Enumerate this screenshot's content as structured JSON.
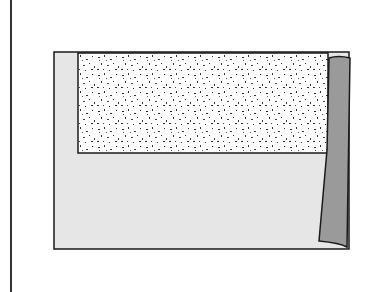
{
  "figure": {
    "colors": {
      "background": "#ffffff",
      "outline": "#1a1a1a",
      "base_fill": "#e6e6e6",
      "speckle_fill": "#ffffff",
      "speckle_dots": "#2a2a2a",
      "strip_fill": "#9a9a9a"
    },
    "regions": [
      {
        "name": "frame-left-edge"
      },
      {
        "name": "base-region"
      },
      {
        "name": "speckled-region"
      },
      {
        "name": "side-strip"
      }
    ]
  }
}
